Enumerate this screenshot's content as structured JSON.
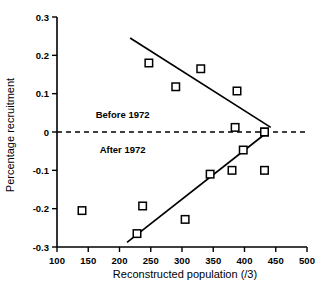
{
  "chart_data": {
    "type": "scatter",
    "title": "",
    "xlabel": "Reconstructed population (/3)",
    "ylabel": "Percentage recruitment",
    "xlim": [
      100,
      500
    ],
    "ylim": [
      -0.3,
      0.3
    ],
    "xticks": [
      100,
      150,
      200,
      250,
      300,
      350,
      400,
      450,
      500
    ],
    "yticks": [
      0.3,
      0.2,
      0.1,
      0,
      -0.1,
      -0.2,
      -0.3
    ],
    "xtick_labels": [
      "100",
      "150",
      "200",
      "250",
      "300",
      "350",
      "400",
      "450",
      "500"
    ],
    "ytick_labels": [
      "0.3",
      "0.2",
      "0.1",
      "0",
      "-0.1",
      "-0.2",
      "-0.3"
    ],
    "grid": false,
    "legend_position": "inline-annotations",
    "annotations": [
      {
        "text": "Before 1972",
        "x": 205,
        "y": 0.045
      },
      {
        "text": "After 1972",
        "x": 205,
        "y": -0.047
      }
    ],
    "reference_lines": [
      {
        "name": "zero-line",
        "orientation": "horizontal",
        "value": 0,
        "style": "dashed"
      }
    ],
    "series": [
      {
        "name": "Before 1972",
        "marker": "open-square",
        "points": [
          {
            "x": 247,
            "y": 0.18
          },
          {
            "x": 290,
            "y": 0.118
          },
          {
            "x": 330,
            "y": 0.165
          },
          {
            "x": 388,
            "y": 0.107
          },
          {
            "x": 385,
            "y": 0.012
          },
          {
            "x": 432,
            "y": 0.0
          }
        ],
        "fit_line": {
          "x0": 217,
          "y0": 0.245,
          "x1": 442,
          "y1": 0.012
        }
      },
      {
        "name": "After 1972",
        "marker": "open-square",
        "points": [
          {
            "x": 140,
            "y": -0.205
          },
          {
            "x": 228,
            "y": -0.265
          },
          {
            "x": 237,
            "y": -0.193
          },
          {
            "x": 305,
            "y": -0.228
          },
          {
            "x": 345,
            "y": -0.11
          },
          {
            "x": 380,
            "y": -0.1
          },
          {
            "x": 398,
            "y": -0.047
          },
          {
            "x": 432,
            "y": -0.1
          },
          {
            "x": 432,
            "y": 0.0
          }
        ],
        "fit_line": {
          "x0": 212,
          "y0": -0.288,
          "x1": 437,
          "y1": 0.0
        }
      }
    ]
  },
  "figure": {
    "name": "percentage-recruitment-vs-reconstructed-population"
  }
}
